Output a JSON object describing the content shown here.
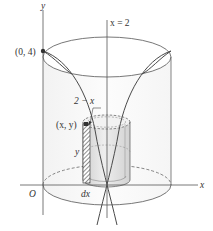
{
  "figure": {
    "type": "shell-method-solid-of-revolution",
    "labels": {
      "y_axis": "y",
      "x_axis": "x",
      "origin": "O",
      "axis_of_rotation": "x = 2",
      "point_top": "(0, 4)",
      "point_curve": "(x, y)",
      "radius": "2 − x",
      "height": "y",
      "thickness": "dx"
    },
    "colors": {
      "stroke": "#555555",
      "curve": "#4a4a4a",
      "shade": "#d9d9d9",
      "shade_light": "#ececec",
      "point": "#333333"
    }
  }
}
